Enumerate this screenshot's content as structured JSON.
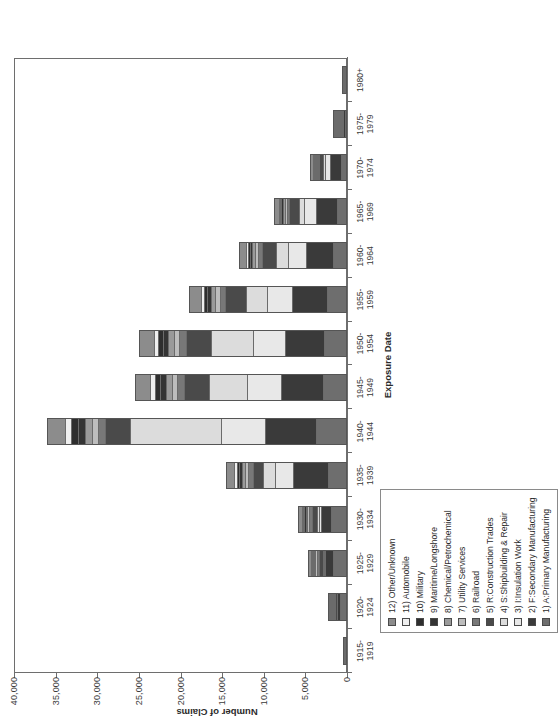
{
  "chart_data": {
    "type": "bar",
    "subtype": "stacked-vertical",
    "title": "",
    "xlabel": "Exposure Date",
    "ylabel": "Number of Claims",
    "ylim": [
      0,
      40000
    ],
    "ytick_labels": [
      "0",
      "5,000",
      "10,000",
      "15,000",
      "20,000",
      "25,000",
      "30,000",
      "35,000",
      "40,000"
    ],
    "ytick_values": [
      0,
      5000,
      10000,
      15000,
      20000,
      25000,
      30000,
      35000,
      40000
    ],
    "grid": false,
    "legend_position": "inside-lower-left",
    "orientation_note": "rendered rotated 90 degrees counter-clockwise",
    "categories": [
      "1915-\n1919",
      "1920-\n1924",
      "1925-\n1929",
      "1930-\n1934",
      "1935-\n1939",
      "1940-\n1944",
      "1945-\n1949",
      "1950-\n1954",
      "1955-\n1959",
      "1960-\n1964",
      "1965-\n1969",
      "1970-\n1974",
      "1975-\n1979",
      "1980+"
    ],
    "category_lines": [
      [
        "1915-",
        "1919"
      ],
      [
        "1920-",
        "1924"
      ],
      [
        "1925-",
        "1929"
      ],
      [
        "1930-",
        "1934"
      ],
      [
        "1935-",
        "1939"
      ],
      [
        "1940-",
        "1944"
      ],
      [
        "1945-",
        "1949"
      ],
      [
        "1950-",
        "1954"
      ],
      [
        "1955-",
        "1959"
      ],
      [
        "1960-",
        "1964"
      ],
      [
        "1965-",
        "1969"
      ],
      [
        "1970-",
        "1974"
      ],
      [
        "1975-",
        "1979"
      ],
      [
        "1980+",
        ""
      ]
    ],
    "series": [
      {
        "name": "1) A:Primary Manufacturing",
        "color": "#6e6e6e",
        "values": [
          300,
          900,
          1500,
          1700,
          2100,
          3500,
          2700,
          2600,
          2200,
          1500,
          1000,
          600,
          250,
          120
        ]
      },
      {
        "name": "2) F:Secondary Manufacturing",
        "color": "#3a3a3a",
        "values": [
          80,
          600,
          1100,
          1300,
          4200,
          6200,
          5100,
          4700,
          4300,
          3300,
          2600,
          1400,
          700,
          180
        ]
      },
      {
        "name": "3) I:Insulation Work",
        "color": "#e8e8e8",
        "values": [
          0,
          0,
          150,
          250,
          2200,
          5300,
          4100,
          3900,
          3000,
          2200,
          1500,
          700,
          120,
          30
        ]
      },
      {
        "name": "4) S:Shipbuilding & Repair",
        "color": "#dcdcdc",
        "values": [
          0,
          0,
          120,
          220,
          1500,
          11000,
          4600,
          5000,
          2500,
          1400,
          600,
          250,
          60,
          20
        ]
      },
      {
        "name": "5) R:Construction Trades",
        "color": "#4a4a4a",
        "values": [
          30,
          250,
          500,
          700,
          1300,
          3000,
          3000,
          3100,
          2600,
          1800,
          1200,
          500,
          150,
          60
        ]
      },
      {
        "name": "6) Railroad",
        "color": "#787878",
        "values": [
          20,
          120,
          260,
          330,
          500,
          900,
          850,
          800,
          650,
          430,
          300,
          150,
          50,
          20
        ]
      },
      {
        "name": "7) Utility Services",
        "color": "#bdbdbd",
        "values": [
          10,
          60,
          160,
          210,
          380,
          700,
          650,
          620,
          520,
          340,
          230,
          110,
          40,
          15
        ]
      },
      {
        "name": "8) Chemical/Petrochemical",
        "color": "#9a9a9a",
        "values": [
          10,
          70,
          180,
          240,
          420,
          800,
          760,
          720,
          580,
          380,
          260,
          120,
          45,
          15
        ]
      },
      {
        "name": "9) Maritime/Longshore",
        "color": "#343434",
        "values": [
          10,
          50,
          130,
          170,
          340,
          950,
          700,
          650,
          430,
          260,
          170,
          80,
          30,
          10
        ]
      },
      {
        "name": "10) Military",
        "color": "#2e2e2e",
        "values": [
          5,
          40,
          110,
          150,
          300,
          850,
          620,
          560,
          380,
          230,
          150,
          70,
          25,
          10
        ]
      },
      {
        "name": "11) Automobile",
        "color": "#efefef",
        "values": [
          5,
          40,
          100,
          140,
          300,
          650,
          560,
          520,
          380,
          250,
          180,
          90,
          35,
          15
        ]
      },
      {
        "name": "12) Other/Unknown",
        "color": "#8c8c8c",
        "values": [
          30,
          170,
          390,
          490,
          960,
          2150,
          1860,
          1830,
          1460,
          910,
          610,
          330,
          195,
          55
        ]
      }
    ]
  },
  "legend": {
    "entries": [
      {
        "label": "12) Other/Unknown",
        "color": "#8c8c8c"
      },
      {
        "label": "11) Automobile",
        "color": "#efefef"
      },
      {
        "label": "10) Military",
        "color": "#2e2e2e"
      },
      {
        "label": "9) Maritime/Longshore",
        "color": "#343434"
      },
      {
        "label": "8) Chemical/Petrochemical",
        "color": "#9a9a9a"
      },
      {
        "label": "7) Utility Services",
        "color": "#bdbdbd"
      },
      {
        "label": "6) Railroad",
        "color": "#787878"
      },
      {
        "label": "5) R:Construction Trades",
        "color": "#4a4a4a"
      },
      {
        "label": "4) S:Shipbuilding & Repair",
        "color": "#dcdcdc"
      },
      {
        "label": "3) I:Insulation Work",
        "color": "#e8e8e8"
      },
      {
        "label": "2) F:Secondary Manufacturing",
        "color": "#3a3a3a"
      },
      {
        "label": "1) A:Primary Manufacturing",
        "color": "#6e6e6e"
      }
    ]
  }
}
